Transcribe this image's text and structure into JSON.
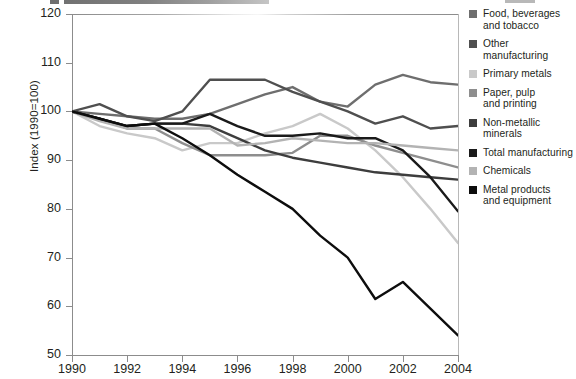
{
  "chart_data": {
    "type": "line",
    "title": "",
    "xlabel": "",
    "ylabel": "Index (1990=100)",
    "xlim": [
      1990,
      2004
    ],
    "ylim": [
      50,
      120
    ],
    "yticks": [
      50,
      60,
      70,
      80,
      90,
      100,
      110,
      120
    ],
    "xticks": [
      1990,
      1992,
      1994,
      1996,
      1998,
      2000,
      2002,
      2004
    ],
    "xtick_labels": [
      "1990",
      "1992",
      "1994",
      "1996",
      "1998",
      "2000",
      "2002",
      "2004"
    ],
    "ytick_labels": [
      "50",
      "60",
      "70",
      "80",
      "90",
      "100",
      "110",
      "120"
    ],
    "grid": false,
    "legend_position": "right",
    "x": [
      1990,
      1991,
      1992,
      1993,
      1994,
      1995,
      1996,
      1997,
      1998,
      1999,
      2000,
      2001,
      2002,
      2003,
      2004
    ],
    "series": [
      {
        "name": "Food, beverages and tobacco",
        "color": "#6e6e6e",
        "values": [
          100,
          99.5,
          99,
          98.5,
          98.5,
          99.5,
          101.5,
          103.5,
          105,
          102,
          101,
          105.5,
          107.5,
          106,
          105.5
        ]
      },
      {
        "name": "Other manufacturing",
        "color": "#4f4f4f",
        "values": [
          100,
          101.5,
          99,
          98,
          100,
          106.5,
          106.5,
          106.5,
          104,
          102,
          100,
          97.5,
          99,
          96.5,
          97
        ]
      },
      {
        "name": "Primary metals",
        "color": "#c9c9c9",
        "values": [
          100,
          97,
          95.5,
          94.5,
          92,
          93.5,
          93.5,
          95.5,
          97,
          99.5,
          96.5,
          92,
          86.5,
          80,
          73
        ]
      },
      {
        "name": "Paper, pulp and printing",
        "color": "#8e8e8e",
        "values": [
          100,
          98.5,
          96.5,
          96.5,
          93.5,
          91,
          91,
          91,
          91.5,
          95,
          95,
          93,
          91.5,
          90,
          88.5
        ]
      },
      {
        "name": "Non-metallic minerals",
        "color": "#3d3d3d",
        "values": [
          100,
          98.5,
          97,
          97.5,
          97.5,
          97,
          94.5,
          92,
          90.5,
          89.5,
          88.5,
          87.5,
          87,
          86.5,
          86
        ]
      },
      {
        "name": "Total manufacturing",
        "color": "#1a1a1a",
        "values": [
          100,
          98.5,
          97,
          97.5,
          97.5,
          99.5,
          97,
          95,
          95,
          95.5,
          94.5,
          94.5,
          92,
          86.5,
          79.5
        ]
      },
      {
        "name": "Chemicals",
        "color": "#b3b3b3",
        "values": [
          100,
          98,
          96.5,
          96.5,
          96.5,
          96.5,
          93,
          93.5,
          94.5,
          94,
          93.5,
          93.5,
          93,
          92.5,
          92
        ]
      },
      {
        "name": "Metal products and equipment",
        "color": "#0d0d0d",
        "values": [
          100,
          98.5,
          97,
          97.5,
          94.5,
          91,
          87,
          83.5,
          80,
          74.5,
          70,
          61.5,
          65,
          59.5,
          54
        ]
      }
    ]
  },
  "legend": {
    "items": [
      {
        "label_line1": "Food, beverages",
        "label_line2": "and tobacco"
      },
      {
        "label_line1": "Other",
        "label_line2": "manufacturing"
      },
      {
        "label_line1": "Primary metals",
        "label_line2": ""
      },
      {
        "label_line1": "Paper, pulp",
        "label_line2": "and printing"
      },
      {
        "label_line1": "Non-metallic",
        "label_line2": "minerals"
      },
      {
        "label_line1": "Total manufacturing",
        "label_line2": ""
      },
      {
        "label_line1": "Chemicals",
        "label_line2": ""
      },
      {
        "label_line1": "Metal products",
        "label_line2": "and equipment"
      }
    ]
  }
}
